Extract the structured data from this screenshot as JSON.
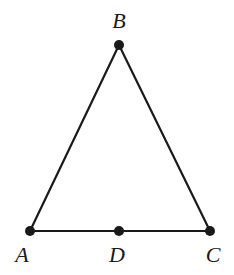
{
  "diagram": {
    "type": "geometry-triangle",
    "colors": {
      "line": "#1a1a1a",
      "point": "#1a1a1a",
      "background": "#ffffff"
    },
    "points": {
      "A": {
        "label": "A",
        "x": 30,
        "y": 231
      },
      "B": {
        "label": "B",
        "x": 119,
        "y": 45
      },
      "C": {
        "label": "C",
        "x": 210,
        "y": 231
      },
      "D": {
        "label": "D",
        "x": 119,
        "y": 231
      }
    },
    "segments": [
      [
        "A",
        "B"
      ],
      [
        "B",
        "C"
      ],
      [
        "A",
        "C"
      ]
    ]
  }
}
